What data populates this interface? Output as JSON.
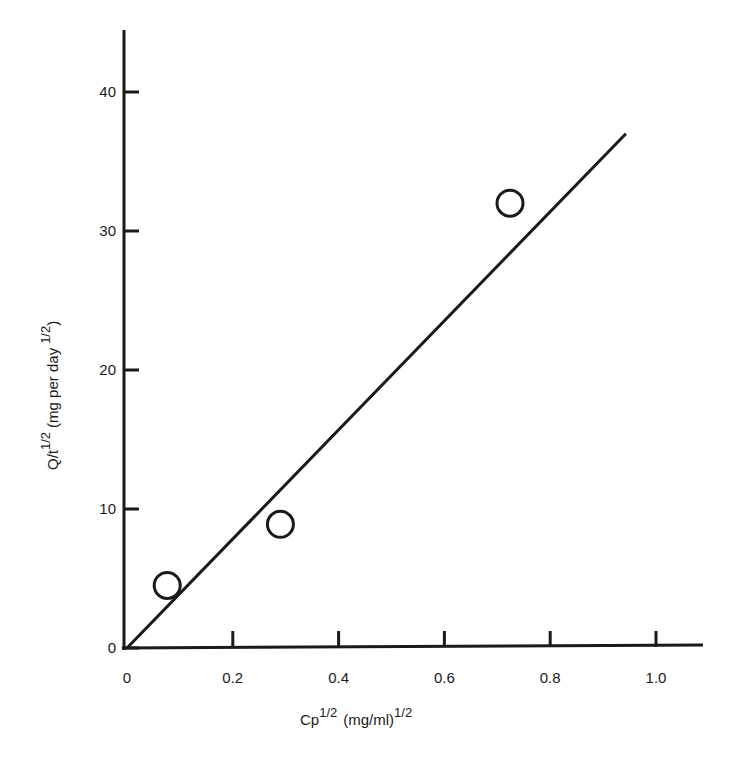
{
  "chart_data": {
    "type": "scatter",
    "title": "",
    "xlabel": "Cp^1/2 (mg/ml)^1/2",
    "ylabel": "Q/t^1/2 (mg per day^1/2)",
    "xlabel_parts": {
      "main": "Cp",
      "main_sup": "1/2",
      "unit": "(mg/ml)",
      "unit_sup": "1/2"
    },
    "ylabel_parts": {
      "main": "Q/t",
      "main_sup": "1/2",
      "unit": "(mg per day",
      "unit_sup": "1/2",
      "unit_close": ")"
    },
    "xlim": [
      0,
      1.08
    ],
    "ylim": [
      0,
      44
    ],
    "x_ticks": [
      0,
      0.2,
      0.4,
      0.6,
      0.8,
      1.0
    ],
    "x_tick_labels": [
      "0",
      "0.2",
      "0.4",
      "0.6",
      "0.8",
      "1.0"
    ],
    "y_ticks": [
      0,
      10,
      20,
      30,
      40
    ],
    "y_tick_labels": [
      "0",
      "10",
      "20",
      "30",
      "40"
    ],
    "grid": false,
    "legend": null,
    "series": [
      {
        "name": "observed",
        "marker": "open-circle",
        "x": [
          0.076,
          0.29,
          0.724
        ],
        "y": [
          4.5,
          8.9,
          32.0
        ]
      },
      {
        "name": "fit-line",
        "type": "line",
        "x": [
          0,
          0.943
        ],
        "y": [
          0,
          37.0
        ]
      }
    ]
  }
}
